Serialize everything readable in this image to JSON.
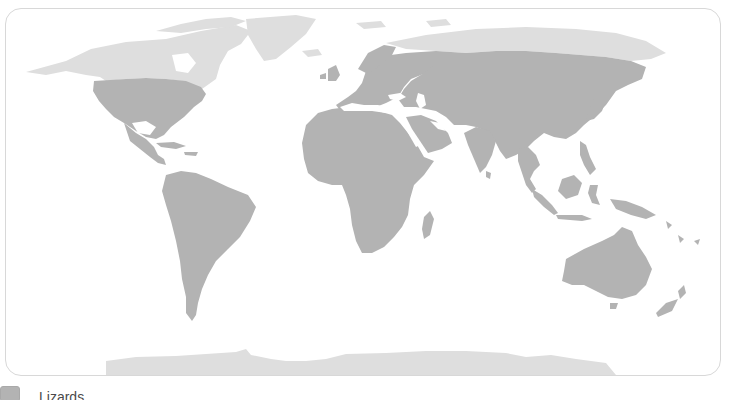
{
  "map": {
    "title": "",
    "projection": "world, Pacific-centered-excluded (standard Atlantic-centered)",
    "colors": {
      "range": "#b3b3b3",
      "non_range_land": "#dedede",
      "ocean": "#ffffff",
      "frame_border": "#d8d8d8"
    }
  },
  "legend": {
    "items": [
      {
        "label": "Lizards",
        "color": "#b3b3b3"
      }
    ]
  }
}
